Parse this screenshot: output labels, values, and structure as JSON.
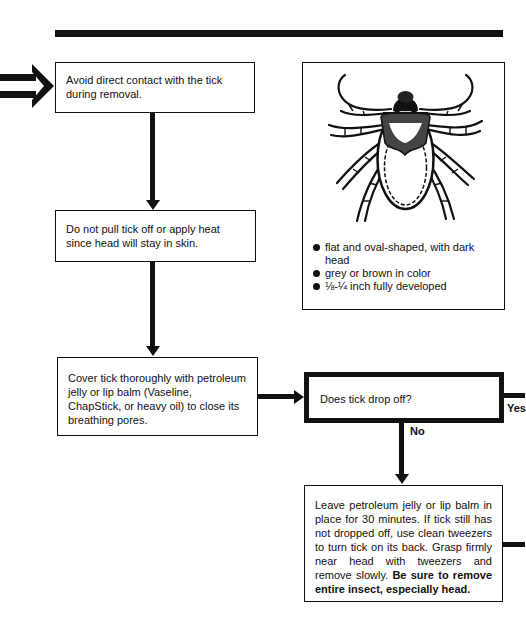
{
  "diagram": {
    "entry_arrow": {
      "icon": "double-arrow-right-icon"
    },
    "steps": [
      {
        "id": "step1",
        "text": "Avoid direct contact with the tick during removal."
      },
      {
        "id": "step2",
        "text": "Do not pull tick off or apply heat since head will stay in skin."
      },
      {
        "id": "step3",
        "text": "Cover tick thoroughly with petroleum jelly or lip balm (Vaseline, ChapStick, or heavy oil) to close its breathing pores."
      },
      {
        "id": "decision",
        "text": "Does tick drop off?"
      },
      {
        "id": "step5",
        "text": "Leave petroleum jelly or lip balm in place for 30 minutes. If tick still has not dropped off, use clean tweezers to turn tick on its back. Grasp firmly near head with tweezers and remove slowly.",
        "emphasis": "Be sure to remove entire insect, especially head."
      }
    ],
    "branches": {
      "yes": "Yes",
      "no": "No"
    },
    "tick_panel": {
      "image": "tick-illustration",
      "bullets": [
        "flat and oval-shaped, with dark head",
        "grey or brown in color",
        "⅛-¼ inch fully developed"
      ]
    },
    "colors": {
      "ink": "#111111",
      "paper": "#ffffff"
    }
  }
}
